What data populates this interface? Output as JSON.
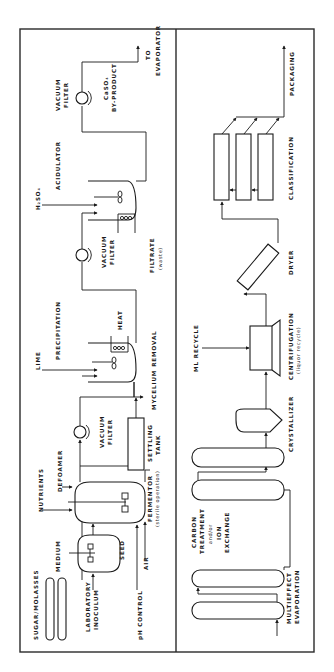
{
  "diagram": {
    "orientation": "rotated 90 degrees counter-clockwise",
    "upper_panel": {
      "labels": {
        "sugar_molasses": "SUGAR/MOLASSES",
        "medium": "MEDIUM",
        "laboratory": "LABORATORY",
        "inoculum": "INOCULUM",
        "seed": "SEED",
        "nutrients": "NUTRIENTS",
        "defoamer": "DEFOAMER",
        "ph_control": "pH CONTROL",
        "air": "AIR",
        "fermentor": "FERMENTOR",
        "fermentor_note": "(sterile operation)",
        "vacuum_filter_1_a": "VACUUM",
        "vacuum_filter_1_b": "FILTER",
        "settling": "SETTLING",
        "tank": "TANK",
        "mycelium_removal": "MYCELIUM REMOVAL",
        "lime": "LIME",
        "precipitation": "PRECIPITATION",
        "heat": "HEAT",
        "vacuum_filter_2_a": "VACUUM",
        "vacuum_filter_2_b": "FILTER",
        "filtrate": "FILTRATE",
        "filtrate_note": "(waste)",
        "h2so4": "H₂SO₄",
        "acidulator": "ACIDULATOR",
        "vacuum_filter_3_a": "VACUUM",
        "vacuum_filter_3_b": "FILTER",
        "caso4": "CaSO₄",
        "by_product": "BY-PRODUCT",
        "to": "TO",
        "evaporator": "EVAPORATOR"
      }
    },
    "lower_panel": {
      "labels": {
        "multieffect": "MULTIEFFECT",
        "evaporation": "EVAPORATION",
        "carbon": "CARBON",
        "treatment": "TREATMENT",
        "andor": "and/or",
        "ion": "ION",
        "exchange": "EXCHANGE",
        "crystallizer": "CRYSTALLIZER",
        "ml_recycle": "ML RECYCLE",
        "centrifugation": "CENTRIFUGATION",
        "centrifugation_note": "(liquor recycle)",
        "dryer": "DRYER",
        "classification": "CLASSIFICATION",
        "packaging": "PACKAGING"
      }
    }
  }
}
